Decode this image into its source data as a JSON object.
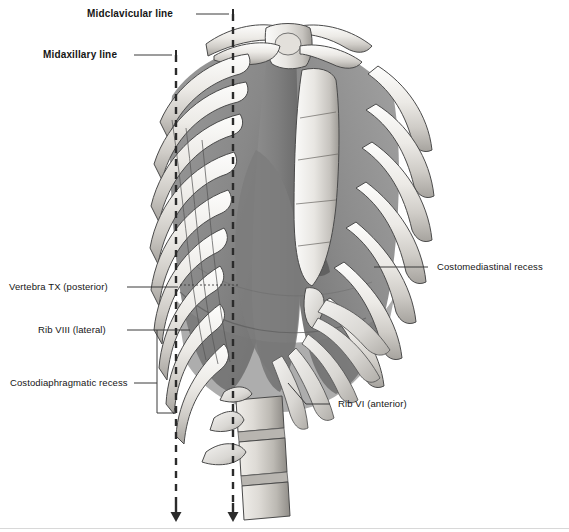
{
  "figure": {
    "type": "anatomical-illustration",
    "palette": {
      "background": "#ffffff",
      "bone_light": "#f2f1ef",
      "bone_mid": "#d5d3cf",
      "bone_shadow": "#a9a6a1",
      "pleura_mid": "#8d8d8d",
      "pleura_dark": "#6e6e6e",
      "pleura_light": "#a6a6a6",
      "outline": "#3d3d3d",
      "leader_line": "#3a3a3a",
      "text": "#161616",
      "baseline_rule": "#d8d8d8"
    }
  },
  "labels": {
    "midclavicular_line": "Midclavicular line",
    "midaxillary_line": "Midaxillary line",
    "vertebra_tx": "Vertebra TX (posterior)",
    "rib_viii": "Rib VIII (lateral)",
    "costodiaphragmatic_recess": "Costodiaphragmatic recess",
    "costomediastinal_recess": "Costomediastinal recess",
    "rib_vi": "Rib VI (anterior)"
  },
  "reference_lines": [
    {
      "name": "midclavicular-line",
      "style": "dashed",
      "x": 233,
      "y_top": 14,
      "y_bottom": 503,
      "arrow": "down",
      "arrow_tip_y": 521
    },
    {
      "name": "midaxillary-line",
      "style": "dashed",
      "x": 176,
      "y_top": 55,
      "y_bottom": 503,
      "arrow": "down",
      "arrow_tip_y": 521
    }
  ],
  "icons": {
    "arrow_down": "down-arrow-icon",
    "tick_mark": "tick-mark-icon"
  }
}
